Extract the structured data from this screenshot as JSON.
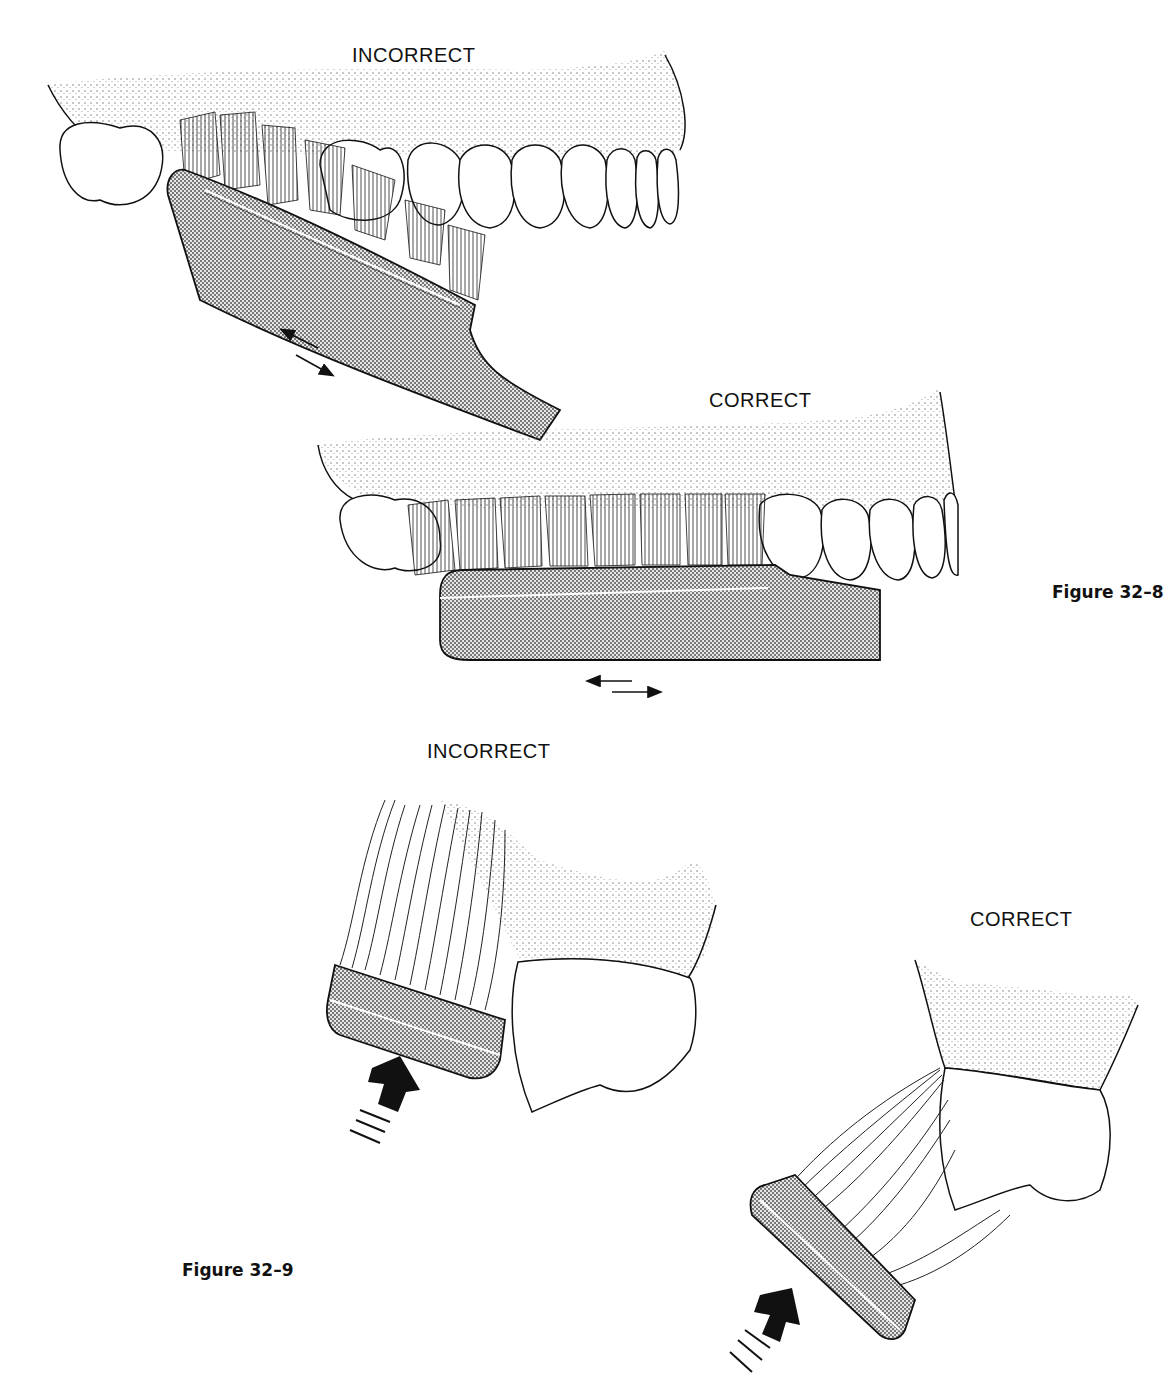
{
  "figures": [
    {
      "id": "figure-32-8",
      "caption": "Figure 32–8",
      "panels": [
        {
          "label": "INCORRECT",
          "view": "facial view of maxillary teeth",
          "brush_orientation": "angled diagonally across teeth",
          "motion": "horizontal back-and-forth scrub",
          "motion_icon": "bidirectional-arrow-icon"
        },
        {
          "label": "CORRECT",
          "view": "facial view of maxillary teeth",
          "brush_orientation": "parallel to occlusal plane, bristles at gingival margin",
          "motion": "short horizontal back-and-forth",
          "motion_icon": "bidirectional-arrow-icon"
        }
      ]
    },
    {
      "id": "figure-32-9",
      "caption": "Figure 32–9",
      "panels": [
        {
          "label": "INCORRECT",
          "view": "cross-section of tooth and gingiva",
          "bristle_state": "bent over, splayed away from sulcus",
          "pressure_icon": "pressure-arrow-icon"
        },
        {
          "label": "CORRECT",
          "view": "cross-section of tooth and gingiva",
          "bristle_state": "flexed into gingival sulcus",
          "pressure_icon": "pressure-arrow-icon"
        }
      ]
    }
  ],
  "colors": {
    "ink": "#111111",
    "background": "#ffffff",
    "stipple": "#555555",
    "handle_fill": "#bdbdbd"
  }
}
